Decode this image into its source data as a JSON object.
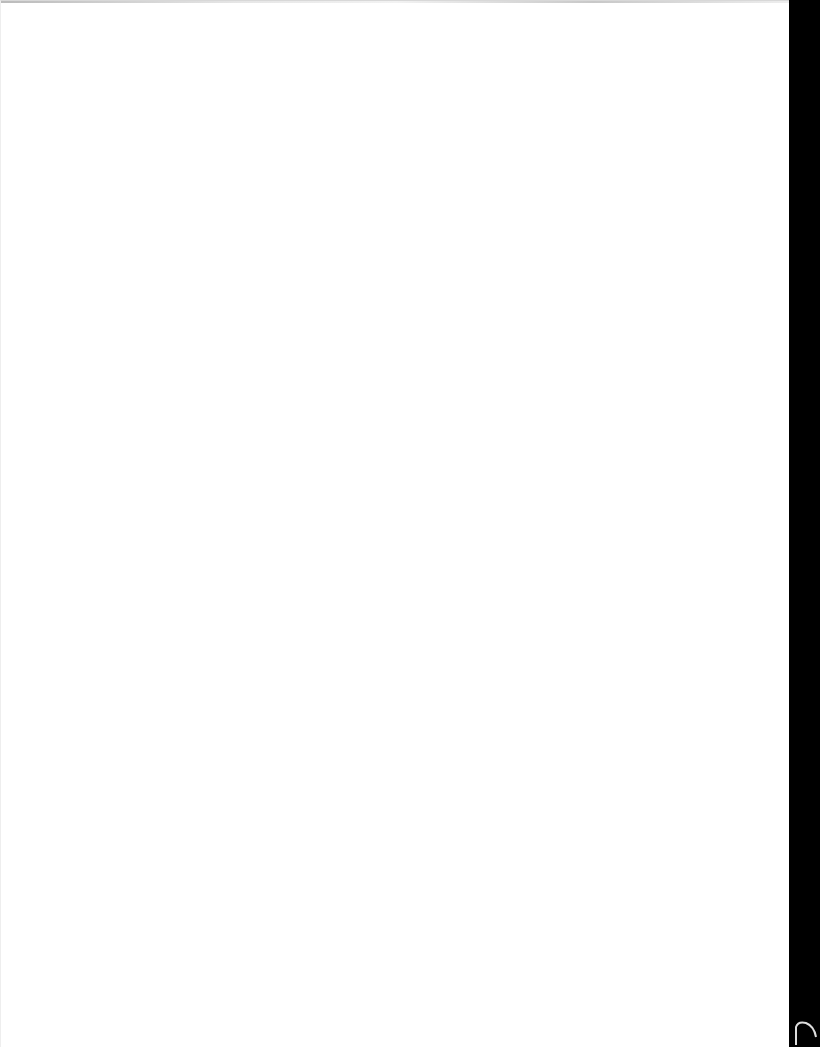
{
  "document": {
    "type": "scanned-page",
    "content_text": "",
    "is_blank": true
  },
  "colors": {
    "page_background": "#ffffff",
    "scanner_edge": "#000000"
  }
}
